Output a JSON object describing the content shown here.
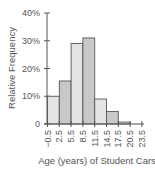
{
  "chart_data": {
    "type": "bar",
    "title": "",
    "xlabel": "Age (years) of Student Cars",
    "ylabel": "Relative Frequency",
    "ylim": [
      0,
      40
    ],
    "yticks": [
      "0",
      "10%",
      "20%",
      "30%",
      "40%"
    ],
    "xticks": [
      "-0.5",
      "2.5",
      "5.5",
      "8.5",
      "11.5",
      "14.5",
      "17.5",
      "20.5",
      "23.5"
    ],
    "categories": [
      "-0.5–2.5",
      "2.5–5.5",
      "5.5–8.5",
      "8.5–11.5",
      "11.5–14.5",
      "14.5–17.5",
      "17.5–20.5",
      "20.5–23.5"
    ],
    "values": [
      10,
      15.5,
      29,
      31,
      9,
      4.5,
      0.7,
      0
    ],
    "grid": false,
    "histogram": true,
    "colors": {
      "light": "#e4e4e4",
      "dark": "#c8c8c8",
      "outline": "#555555"
    }
  }
}
